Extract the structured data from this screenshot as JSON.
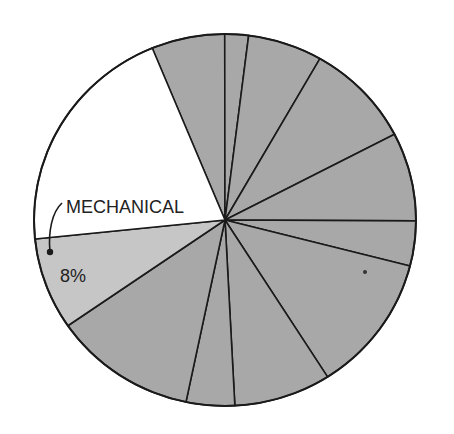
{
  "chart_data": {
    "type": "pie",
    "title": "",
    "start_angle_deg": 247.6,
    "direction": "clockwise",
    "slices": [
      {
        "label": "",
        "percent": 6.2,
        "color": "#a8a8a8"
      },
      {
        "label": "",
        "percent": 2.0,
        "color": "#a8a8a8"
      },
      {
        "label": "",
        "percent": 6.3,
        "color": "#a8a8a8"
      },
      {
        "label": "",
        "percent": 9.1,
        "color": "#a8a8a8"
      },
      {
        "label": "",
        "percent": 7.7,
        "color": "#a8a8a8"
      },
      {
        "label": "",
        "percent": 3.9,
        "color": "#a8a8a8"
      },
      {
        "label": "",
        "percent": 12.0,
        "color": "#a8a8a8"
      },
      {
        "label": "",
        "percent": 8.2,
        "color": "#a8a8a8"
      },
      {
        "label": "",
        "percent": 4.1,
        "color": "#a8a8a8"
      },
      {
        "label": "",
        "percent": 12.1,
        "color": "#a8a8a8"
      },
      {
        "label": "",
        "percent": 8.0,
        "color": "#c6c6c6",
        "value_label": "8%"
      },
      {
        "label": "MECHANICAL",
        "percent": 20.4,
        "color": "#ffffff"
      }
    ],
    "annotations": {
      "category_label": "MECHANICAL",
      "value_label": "8%"
    },
    "legend": "none"
  }
}
